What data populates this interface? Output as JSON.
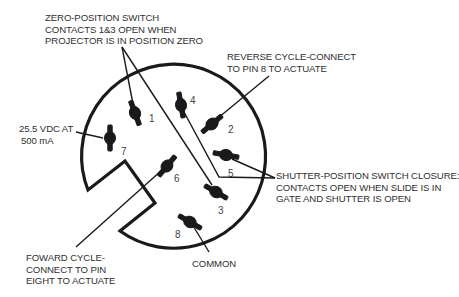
{
  "diagram": {
    "type": "connector-pinout",
    "pins": [
      {
        "num": "1",
        "x": 133,
        "y": 114
      },
      {
        "num": "2",
        "x": 214,
        "y": 125
      },
      {
        "num": "3",
        "x": 220,
        "y": 200
      },
      {
        "num": "4",
        "x": 181,
        "y": 103
      },
      {
        "num": "5",
        "x": 227,
        "y": 158
      },
      {
        "num": "6",
        "x": 165,
        "y": 180
      },
      {
        "num": "7",
        "x": 108,
        "y": 136
      },
      {
        "num": "8",
        "x": 190,
        "y": 220
      }
    ],
    "labels": {
      "zero_position": [
        "ZERO-POSITION SWITCH",
        "CONTACTS 1&3 OPEN WHEN",
        "PROJECTOR IS IN POSITION ZERO"
      ],
      "reverse_cycle": [
        "REVERSE CYCLE-CONNECT",
        "TO PIN 8 TO ACTUATE"
      ],
      "power": [
        "25.5 VDC AT",
        "500 mA"
      ],
      "shutter": [
        "SHUTTER-POSITION SWITCH CLOSURE:",
        "CONTACTS OPEN WHEN SLIDE IS IN",
        "GATE AND SHUTTER IS OPEN"
      ],
      "forward_cycle": [
        "FOWARD CYCLE-",
        "CONNECT TO PIN",
        "EIGHT TO ACTUATE"
      ],
      "common": [
        "COMMON"
      ]
    }
  }
}
